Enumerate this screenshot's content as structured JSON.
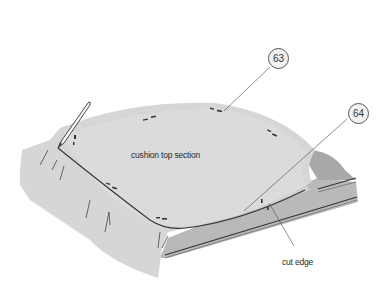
{
  "diagram": {
    "labels": {
      "top_section": "cushion top section",
      "cut_edge": "cut edge"
    },
    "callouts": [
      {
        "number": "63",
        "target": "pin on cushion top section"
      },
      {
        "number": "64",
        "target": "seam line / chalk line on cushion top"
      }
    ],
    "icons": [
      "pencil-icon",
      "pin-marks"
    ],
    "colors": {
      "fabric": "#d6d6d6",
      "fabric_light": "#e2e2e2",
      "foam_side": "#b9b9b9",
      "foam_shadow": "#a8a8a8",
      "line": "#333333",
      "background": "#ffffff"
    }
  }
}
